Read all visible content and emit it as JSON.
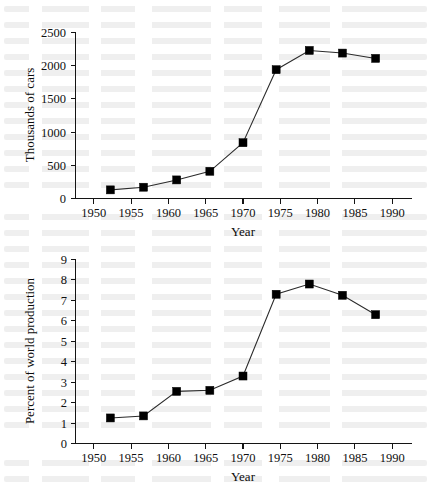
{
  "chart_data": [
    {
      "type": "line",
      "name": "cars-produced",
      "title": "",
      "xlabel": "Year",
      "ylabel": "Thousands of cars",
      "categories": [
        1950,
        1955,
        1960,
        1965,
        1970,
        1975,
        1980,
        1985,
        1990
      ],
      "x": [
        1950,
        1955,
        1960,
        1965,
        1970,
        1975,
        1980,
        1985,
        1990
      ],
      "values": [
        130,
        170,
        280,
        410,
        840,
        1940,
        2230,
        2190,
        2110
      ],
      "xtick_labels": [
        "1950",
        "1955",
        "1960",
        "1965",
        "1970",
        "1975",
        "1980",
        "1985",
        "1990"
      ],
      "ytick_labels": [
        "0",
        "500",
        "1000",
        "1500",
        "2000",
        "2500"
      ],
      "yticks": [
        0,
        500,
        1000,
        1500,
        2000,
        2500
      ],
      "xlim": [
        1947.5,
        1992.5
      ],
      "ylim": [
        0,
        2500
      ],
      "grid": false,
      "legend": "none",
      "marker": "filled-square",
      "marker_color": "#000000",
      "line_color": "#2b2b2b"
    },
    {
      "type": "line",
      "name": "percent-world-production",
      "title": "",
      "xlabel": "Year",
      "ylabel": "Percent of world production",
      "categories": [
        1950,
        1955,
        1960,
        1965,
        1970,
        1975,
        1980,
        1985,
        1990
      ],
      "x": [
        1950,
        1955,
        1960,
        1965,
        1970,
        1975,
        1980,
        1985,
        1990
      ],
      "values": [
        1.25,
        1.35,
        2.55,
        2.6,
        3.3,
        7.3,
        7.8,
        7.25,
        6.3
      ],
      "xtick_labels": [
        "1950",
        "1955",
        "1960",
        "1965",
        "1970",
        "1975",
        "1980",
        "1985",
        "1990"
      ],
      "ytick_labels": [
        "0",
        "1",
        "2",
        "3",
        "4",
        "5",
        "6",
        "7",
        "8",
        "9"
      ],
      "yticks": [
        0,
        1,
        2,
        3,
        4,
        5,
        6,
        7,
        8,
        9
      ],
      "xlim": [
        1947.5,
        1992.5
      ],
      "ylim": [
        0,
        9
      ],
      "grid": false,
      "legend": "none",
      "marker": "filled-square",
      "marker_color": "#000000",
      "line_color": "#2b2b2b"
    }
  ],
  "figures": {
    "cars": {
      "ylabel": "Thousands of cars",
      "xlabel": "Year"
    },
    "percent": {
      "ylabel": "Percent of world production",
      "xlabel": "Year"
    }
  }
}
